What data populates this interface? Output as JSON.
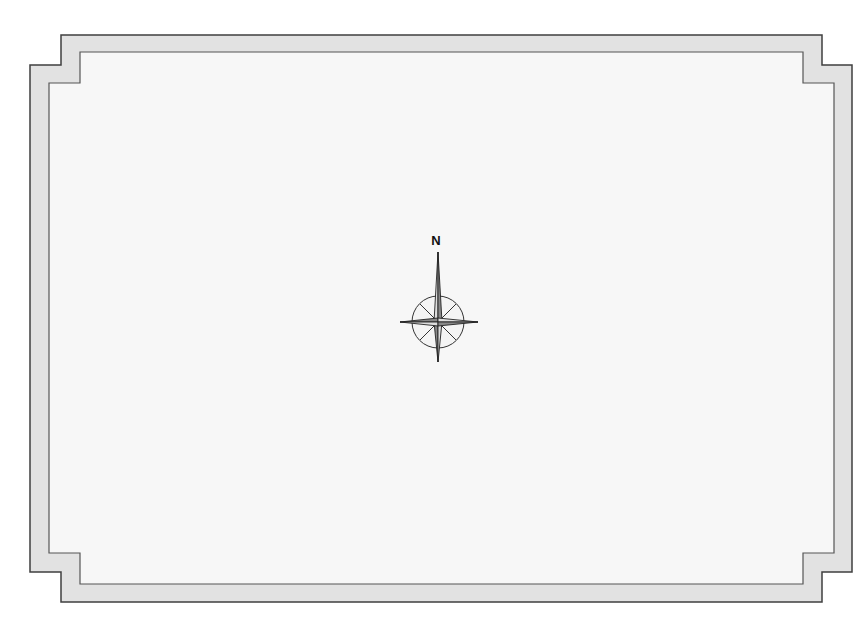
{
  "map": {
    "compass": {
      "label": "N",
      "icon": "compass-rose-icon"
    },
    "colors": {
      "background": "#ffffff",
      "frame_fill": "#e2e2e2",
      "frame_stroke": "#4a4a4a",
      "inner_fill": "#f7f7f7"
    }
  }
}
